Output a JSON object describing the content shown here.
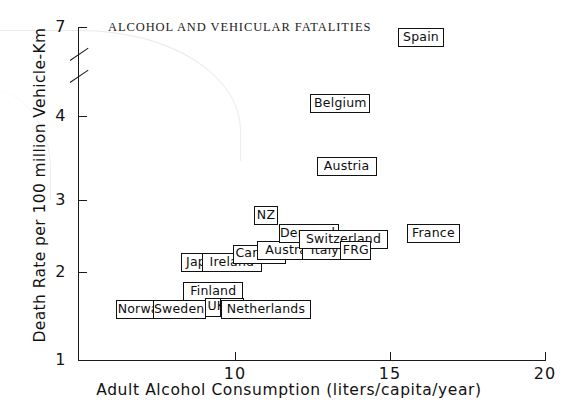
{
  "chart_data": {
    "type": "scatter",
    "title": "ALCOHOL AND VEHICULAR FATALITIES",
    "xlabel": "Adult Alcohol Consumption (liters/capita/year)",
    "ylabel": "Death Rate per 100 million Vehicle-Km",
    "xlim": [
      6.2,
      20
    ],
    "ylim": [
      1,
      7
    ],
    "y_axis_break": {
      "between": [
        4.6,
        6.6
      ],
      "label": "axis-break"
    },
    "xticks": [
      10,
      15,
      20
    ],
    "xtick_labels": [
      "10",
      "15",
      "20"
    ],
    "yticks": [
      1,
      2,
      3,
      4,
      7
    ],
    "ytick_labels": [
      "1",
      "2",
      "3",
      "4",
      "7"
    ],
    "grid": false,
    "legend": "none",
    "point_style": "boxed-country-label",
    "points": [
      {
        "label": "Norway",
        "x": 7.0,
        "y": 1.57
      },
      {
        "label": "Sweden",
        "x": 8.2,
        "y": 1.57
      },
      {
        "label": "Finland",
        "x": 9.3,
        "y": 1.78
      },
      {
        "label": "UK",
        "x": 9.4,
        "y": 1.6
      },
      {
        "label": "US",
        "x": 9.9,
        "y": 1.6
      },
      {
        "label": "Netherlands",
        "x": 11.0,
        "y": 1.57
      },
      {
        "label": "Japan",
        "x": 9.0,
        "y": 2.13
      },
      {
        "label": "Ireland",
        "x": 9.9,
        "y": 2.13
      },
      {
        "label": "Canada",
        "x": 10.8,
        "y": 2.25
      },
      {
        "label": "Australia",
        "x": 11.9,
        "y": 2.3
      },
      {
        "label": "Italy",
        "x": 12.9,
        "y": 2.3
      },
      {
        "label": "NZ",
        "x": 11.0,
        "y": 2.78
      },
      {
        "label": "Denmark",
        "x": 12.4,
        "y": 2.53
      },
      {
        "label": "Switzerland",
        "x": 13.5,
        "y": 2.45
      },
      {
        "label": "FRG",
        "x": 13.9,
        "y": 2.3
      },
      {
        "label": "France",
        "x": 16.4,
        "y": 2.53
      },
      {
        "label": "Austria",
        "x": 13.6,
        "y": 3.4
      },
      {
        "label": "Belgium",
        "x": 13.4,
        "y": 4.25
      },
      {
        "label": "Spain",
        "x": 16.0,
        "y": 6.8
      }
    ]
  }
}
